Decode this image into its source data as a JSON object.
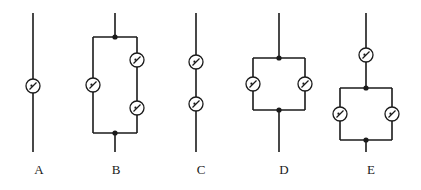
{
  "figure": {
    "background_color": "#ffffff",
    "stroke_color": "#1a1a1a",
    "component_fill": "#ffffff",
    "width": 421,
    "height": 190
  },
  "circuits": [
    {
      "id": "A",
      "label": "A",
      "label_x": 27,
      "label_y": 163,
      "description": "Single resistor in series on a vertical wire",
      "resistor_count": 1,
      "topology": "series",
      "components": [
        {
          "name": "resistor-a1",
          "cx": 33,
          "cy": 86,
          "r": 7
        }
      ],
      "junctions": [],
      "wires": [
        {
          "name": "lead-top",
          "x1": 33,
          "y1": 13,
          "x2": 33,
          "y2": 79
        },
        {
          "name": "lead-bottom",
          "x1": 33,
          "y1": 93,
          "x2": 33,
          "y2": 152
        }
      ]
    },
    {
      "id": "B",
      "label": "B",
      "label_x": 104,
      "label_y": 163,
      "description": "Parallel network: left branch one resistor, right branch two resistors in series",
      "resistor_count": 3,
      "topology": "parallel-with-series-branch",
      "components": [
        {
          "name": "resistor-b1",
          "cx": 93,
          "cy": 85,
          "r": 7
        },
        {
          "name": "resistor-b2",
          "cx": 137,
          "cy": 60,
          "r": 7
        },
        {
          "name": "resistor-b3",
          "cx": 137,
          "cy": 108,
          "r": 7
        }
      ],
      "junctions": [
        {
          "name": "junction-b-top",
          "cx": 115,
          "cy": 37,
          "r": 2.6
        },
        {
          "name": "junction-b-bottom",
          "cx": 115,
          "cy": 133,
          "r": 2.6
        }
      ],
      "wires": [
        {
          "name": "lead-top",
          "x1": 115,
          "y1": 13,
          "x2": 115,
          "y2": 37
        },
        {
          "name": "rail-top",
          "x1": 93,
          "y1": 37,
          "x2": 137,
          "y2": 37
        },
        {
          "name": "rail-bottom",
          "x1": 93,
          "y1": 133,
          "x2": 137,
          "y2": 133
        },
        {
          "name": "branch-left-upper",
          "x1": 93,
          "y1": 37,
          "x2": 93,
          "y2": 78
        },
        {
          "name": "branch-left-lower",
          "x1": 93,
          "y1": 92,
          "x2": 93,
          "y2": 133
        },
        {
          "name": "branch-right-upper",
          "x1": 137,
          "y1": 37,
          "x2": 137,
          "y2": 53
        },
        {
          "name": "branch-right-middle",
          "x1": 137,
          "y1": 67,
          "x2": 137,
          "y2": 101
        },
        {
          "name": "branch-right-lower",
          "x1": 137,
          "y1": 115,
          "x2": 137,
          "y2": 133
        },
        {
          "name": "lead-bottom",
          "x1": 115,
          "y1": 133,
          "x2": 115,
          "y2": 152
        }
      ]
    },
    {
      "id": "C",
      "label": "C",
      "label_x": 189,
      "label_y": 163,
      "description": "Two resistors in series on a single vertical wire",
      "resistor_count": 2,
      "topology": "series",
      "components": [
        {
          "name": "resistor-c1",
          "cx": 196,
          "cy": 62,
          "r": 7
        },
        {
          "name": "resistor-c2",
          "cx": 196,
          "cy": 104,
          "r": 7
        }
      ],
      "junctions": [],
      "wires": [
        {
          "name": "lead-top",
          "x1": 196,
          "y1": 13,
          "x2": 196,
          "y2": 55
        },
        {
          "name": "link-middle",
          "x1": 196,
          "y1": 69,
          "x2": 196,
          "y2": 97
        },
        {
          "name": "lead-bottom",
          "x1": 196,
          "y1": 111,
          "x2": 196,
          "y2": 152
        }
      ]
    },
    {
      "id": "D",
      "label": "D",
      "label_x": 272,
      "label_y": 163,
      "description": "Two resistors in parallel",
      "resistor_count": 2,
      "topology": "parallel",
      "components": [
        {
          "name": "resistor-d1",
          "cx": 253,
          "cy": 84,
          "r": 7
        },
        {
          "name": "resistor-d2",
          "cx": 305,
          "cy": 84,
          "r": 7
        }
      ],
      "junctions": [
        {
          "name": "junction-d-top",
          "cx": 279,
          "cy": 58,
          "r": 2.6
        },
        {
          "name": "junction-d-bottom",
          "cx": 279,
          "cy": 110,
          "r": 2.6
        }
      ],
      "wires": [
        {
          "name": "lead-top",
          "x1": 279,
          "y1": 13,
          "x2": 279,
          "y2": 58
        },
        {
          "name": "rail-top",
          "x1": 253,
          "y1": 58,
          "x2": 305,
          "y2": 58
        },
        {
          "name": "rail-bottom",
          "x1": 253,
          "y1": 110,
          "x2": 305,
          "y2": 110
        },
        {
          "name": "branch-left-upper",
          "x1": 253,
          "y1": 58,
          "x2": 253,
          "y2": 77
        },
        {
          "name": "branch-left-lower",
          "x1": 253,
          "y1": 91,
          "x2": 253,
          "y2": 110
        },
        {
          "name": "branch-right-upper",
          "x1": 305,
          "y1": 58,
          "x2": 305,
          "y2": 77
        },
        {
          "name": "branch-right-lower",
          "x1": 305,
          "y1": 91,
          "x2": 305,
          "y2": 110
        },
        {
          "name": "lead-bottom",
          "x1": 279,
          "y1": 110,
          "x2": 279,
          "y2": 152
        }
      ]
    },
    {
      "id": "E",
      "label": "E",
      "label_x": 359,
      "label_y": 163,
      "description": "One resistor in series followed by two resistors in parallel",
      "resistor_count": 3,
      "topology": "series-then-parallel",
      "components": [
        {
          "name": "resistor-e1",
          "cx": 366,
          "cy": 55,
          "r": 7
        },
        {
          "name": "resistor-e2",
          "cx": 340,
          "cy": 114,
          "r": 7
        },
        {
          "name": "resistor-e3",
          "cx": 392,
          "cy": 114,
          "r": 7
        }
      ],
      "junctions": [
        {
          "name": "junction-e-top",
          "cx": 366,
          "cy": 88,
          "r": 2.6
        },
        {
          "name": "junction-e-bottom",
          "cx": 366,
          "cy": 140,
          "r": 2.6
        }
      ],
      "wires": [
        {
          "name": "lead-top",
          "x1": 366,
          "y1": 13,
          "x2": 366,
          "y2": 48
        },
        {
          "name": "link-series",
          "x1": 366,
          "y1": 62,
          "x2": 366,
          "y2": 88
        },
        {
          "name": "rail-top",
          "x1": 340,
          "y1": 88,
          "x2": 392,
          "y2": 88
        },
        {
          "name": "rail-bottom",
          "x1": 340,
          "y1": 140,
          "x2": 392,
          "y2": 140
        },
        {
          "name": "branch-left-upper",
          "x1": 340,
          "y1": 88,
          "x2": 340,
          "y2": 107
        },
        {
          "name": "branch-left-lower",
          "x1": 340,
          "y1": 121,
          "x2": 340,
          "y2": 140
        },
        {
          "name": "branch-right-upper",
          "x1": 392,
          "y1": 88,
          "x2": 392,
          "y2": 107
        },
        {
          "name": "branch-right-lower",
          "x1": 392,
          "y1": 121,
          "x2": 392,
          "y2": 140
        },
        {
          "name": "lead-bottom",
          "x1": 366,
          "y1": 140,
          "x2": 366,
          "y2": 152
        }
      ]
    }
  ]
}
